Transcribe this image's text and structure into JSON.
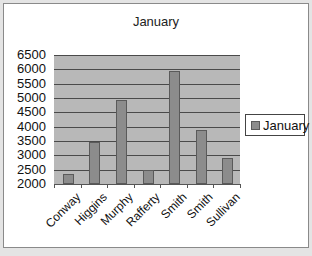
{
  "chart_data": {
    "type": "bar",
    "title": "January",
    "categories": [
      "Conway",
      "Higgins",
      "Murphy",
      "Rafferty",
      "Smith",
      "Smith",
      "Sullivan"
    ],
    "series": [
      {
        "name": "January",
        "values": [
          2350,
          3450,
          4930,
          2500,
          5950,
          3880,
          2900
        ],
        "color": "#8c8c8c"
      }
    ],
    "xlabel": "",
    "ylabel": "",
    "ylim": [
      2000,
      6500
    ],
    "yticks": [
      "6500",
      "6000",
      "5500",
      "5000",
      "4500",
      "4000",
      "3500",
      "3000",
      "2500",
      "2000"
    ],
    "grid": true,
    "legend_position": "right"
  }
}
